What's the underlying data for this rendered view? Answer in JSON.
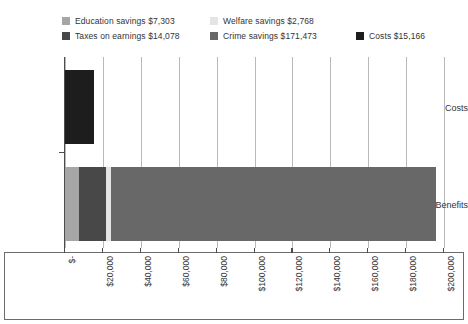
{
  "chart_data": {
    "type": "bar",
    "orientation": "horizontal",
    "stacked": true,
    "title": "",
    "subtitle": "",
    "xlabel": "",
    "ylabel": "",
    "categories": [
      "Costs",
      "Benefits"
    ],
    "xlim": [
      0,
      200000
    ],
    "xtick_values": [
      0,
      20000,
      40000,
      60000,
      80000,
      100000,
      120000,
      140000,
      160000,
      180000,
      200000
    ],
    "xtick_labels": [
      "$-",
      "$20,000",
      "$40,000",
      "$60,000",
      "$80,000",
      "$100,000",
      "$120,000",
      "$140,000",
      "$160,000",
      "$180,000",
      "$200,000"
    ],
    "xtick_rotation": 90,
    "grid": true,
    "grid_axis": "x",
    "legend_position": "top",
    "series": [
      {
        "name": "Education savings",
        "legend_label": "Education savings $7,303",
        "color": "#a6a6a6",
        "value": 7303,
        "values": [
          0,
          7303
        ]
      },
      {
        "name": "Welfare savings",
        "legend_label": "Welfare savings $2,768",
        "color": "#e4e4e4",
        "value": 2768,
        "values": [
          0,
          2768
        ]
      },
      {
        "name": "Taxes on earnings",
        "legend_label": "Taxes on earnings $14,078",
        "color": "#484848",
        "value": 14078,
        "values": [
          0,
          14078
        ]
      },
      {
        "name": "Crime savings",
        "legend_label": "Crime savings $171,473",
        "color": "#686868",
        "value": 171473,
        "values": [
          0,
          171473
        ]
      },
      {
        "name": "Costs",
        "legend_label": "Costs $15,166",
        "color": "#1d1d1d",
        "value": 15166,
        "values": [
          15166,
          0
        ]
      }
    ],
    "bars": [
      {
        "category": "Costs",
        "total": 15166,
        "segments": [
          {
            "name": "Costs",
            "value": 15166,
            "color": "#1d1d1d"
          }
        ]
      },
      {
        "category": "Benefits",
        "total": 195622,
        "segments": [
          {
            "name": "Education savings",
            "value": 7303,
            "color": "#a6a6a6"
          },
          {
            "name": "Taxes on earnings",
            "value": 14078,
            "color": "#484848"
          },
          {
            "name": "Welfare savings",
            "value": 2768,
            "color": "#e4e4e4"
          },
          {
            "name": "Crime savings",
            "value": 171473,
            "color": "#686868"
          }
        ]
      }
    ]
  },
  "legend": {
    "rows": [
      [
        {
          "label": "Education savings $7,303",
          "color": "#a6a6a6",
          "left": 0
        },
        {
          "label": "Welfare savings $2,768",
          "color": "#e4e4e4",
          "left": 148
        }
      ],
      [
        {
          "label": "Taxes on earnings $14,078",
          "color": "#484848",
          "left": 0
        },
        {
          "label": "Crime savings $171,473",
          "color": "#686868",
          "left": 148
        },
        {
          "label": "Costs $15,166",
          "color": "#1d1d1d",
          "left": 294
        }
      ]
    ]
  },
  "axes": {
    "y_categories": [
      "Costs",
      "Benefits"
    ],
    "x_labels": [
      "$-",
      "$20,000",
      "$40,000",
      "$60,000",
      "$80,000",
      "$100,000",
      "$120,000",
      "$140,000",
      "$160,000",
      "$180,000",
      "$200,000"
    ]
  },
  "colors": {
    "education": "#a6a6a6",
    "welfare": "#e4e4e4",
    "taxes": "#484848",
    "crime": "#686868",
    "costs": "#1d1d1d",
    "gridline": "#b9b9b9",
    "axis": "#4d4d4d",
    "text": "#333333",
    "background": "#ffffff"
  }
}
